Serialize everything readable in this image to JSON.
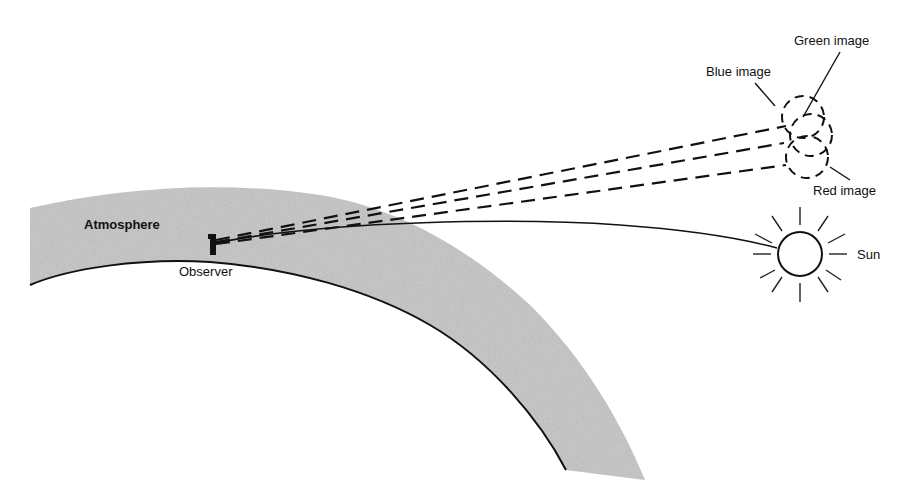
{
  "figure": {
    "labels": {
      "atmosphere": "Atmosphere",
      "observer": "Observer",
      "sun": "Sun",
      "blue_image": "Blue image",
      "green_image": "Green image",
      "red_image": "Red image"
    },
    "colors": {
      "background": "#ffffff",
      "atmosphere_fill": "#c4c4c4",
      "ink": "#111111"
    }
  }
}
